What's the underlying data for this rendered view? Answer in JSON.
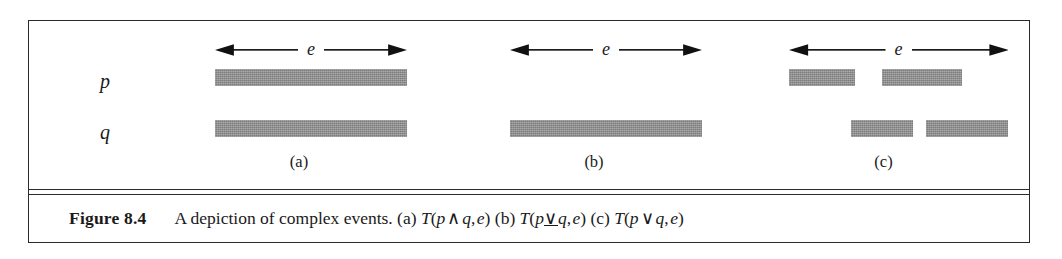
{
  "figure": {
    "row_labels": {
      "p": "p",
      "q": "q"
    },
    "event_arrow_label": "e",
    "bar_color": "#8c8c8c",
    "rule_color": "#2a2a2a",
    "panels": [
      {
        "id": "a",
        "sub_label": "(a)",
        "arrow_label": "e",
        "p_segments": [
          {
            "left": 56,
            "width": 192
          }
        ],
        "q_segments": [
          {
            "left": 56,
            "width": 192
          }
        ]
      },
      {
        "id": "b",
        "sub_label": "(b)",
        "arrow_label": "e",
        "p_segments": [],
        "q_segments": [
          {
            "left": 56,
            "width": 192
          }
        ]
      },
      {
        "id": "c",
        "sub_label": "(c)",
        "arrow_label": "e",
        "p_segments": [
          {
            "left": 48,
            "width": 66
          },
          {
            "left": 141,
            "width": 80
          }
        ],
        "q_segments": [
          {
            "left": 110,
            "width": 62
          },
          {
            "left": 185,
            "width": 82
          }
        ]
      }
    ]
  },
  "caption": {
    "figure_number": "Figure 8.4",
    "lead_text": "A depiction of complex events.",
    "items": [
      {
        "tag": "(a)",
        "formula": "T(p ∧ q, e)",
        "operator": "and"
      },
      {
        "tag": "(b)",
        "formula": "T(p∨̲q, e)",
        "operator": "xor"
      },
      {
        "tag": "(c)",
        "formula": "T(p ∨ q, e)",
        "operator": "or"
      }
    ],
    "full_text": "Figure 8.4    A depiction of complex events. (a) T(p ∧ q, e) (b) T(p∨̲q, e) (c) T(p ∨ q, e)"
  }
}
